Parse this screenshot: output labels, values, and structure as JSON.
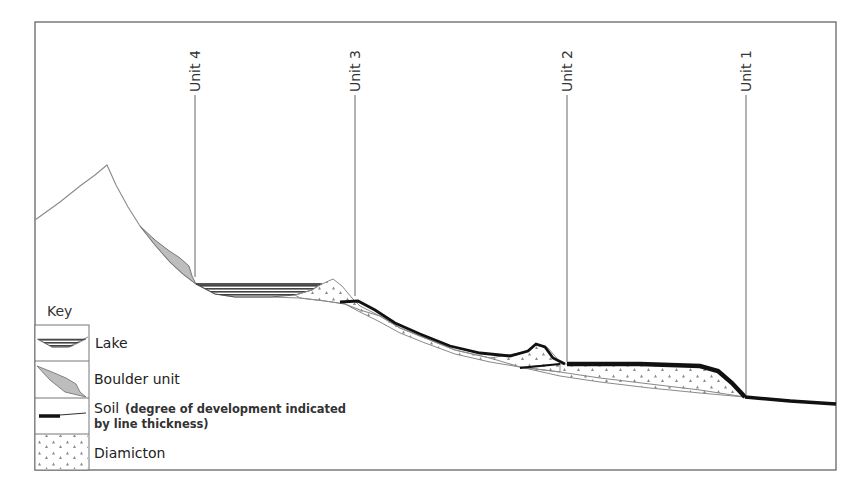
{
  "figure": {
    "type": "schematic cross-section",
    "units": [
      {
        "label": "Unit 4",
        "x": 195
      },
      {
        "label": "Unit 3",
        "x": 355
      },
      {
        "label": "Unit 2",
        "x": 567
      },
      {
        "label": "Unit 1",
        "x": 746
      }
    ]
  },
  "key": {
    "title": "Key",
    "items": [
      {
        "name": "lake",
        "label": "Lake"
      },
      {
        "name": "boulder-unit",
        "label": "Boulder unit"
      },
      {
        "name": "soil",
        "label": "Soil",
        "note_line1": "(degree of development indicated",
        "note_line2": "by line thickness)"
      },
      {
        "name": "diamicton",
        "label": "Diamicton"
      }
    ]
  },
  "colors": {
    "frame": "#666666",
    "terrain_line": "#888888",
    "boulder_fill": "#bdbdbd",
    "lake_fill": "#555555",
    "soil": "#111111",
    "diamicton_dot": "#8a8a8a"
  }
}
